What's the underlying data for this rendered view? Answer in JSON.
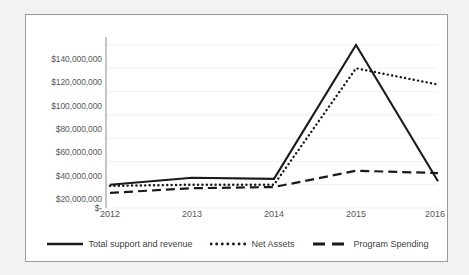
{
  "chart_data": {
    "type": "line",
    "title": "",
    "xlabel": "",
    "ylabel": "",
    "categories": [
      "2012",
      "2013",
      "2014",
      "2015",
      "2016"
    ],
    "x_tick_labels": [
      "2012",
      "2013",
      "2014",
      "2015",
      "2016"
    ],
    "y_tick_labels": [
      "$140,000,000",
      "$120,000,000",
      "$100,000,000",
      "$80,000,000",
      "$60,000,000",
      "$40,000,000",
      "$20,000,000",
      "$-"
    ],
    "y_tick_values": [
      140000000,
      120000000,
      100000000,
      80000000,
      60000000,
      40000000,
      20000000,
      0
    ],
    "ylim": [
      0,
      140000000
    ],
    "grid": true,
    "grid_color": "#f0f0f0",
    "legend_position": "bottom",
    "series": [
      {
        "name": "Total support and revenue",
        "style": "solid",
        "color": "#1a1a1a",
        "values": [
          20000000,
          26000000,
          25000000,
          140000000,
          23000000
        ]
      },
      {
        "name": "Net Assets",
        "style": "dotted",
        "color": "#1a1a1a",
        "values": [
          19000000,
          20000000,
          20000000,
          120000000,
          106000000
        ]
      },
      {
        "name": "Program Spending",
        "style": "dashed",
        "color": "#1a1a1a",
        "values": [
          13000000,
          17000000,
          18000000,
          32000000,
          30000000
        ]
      }
    ]
  },
  "canvas": {
    "background": "#f2f2f2",
    "plot_background": "#ffffff",
    "border_color": "#9a9a9a",
    "axis_color": "#8c8c8c",
    "tick_text_color": "#585858"
  }
}
